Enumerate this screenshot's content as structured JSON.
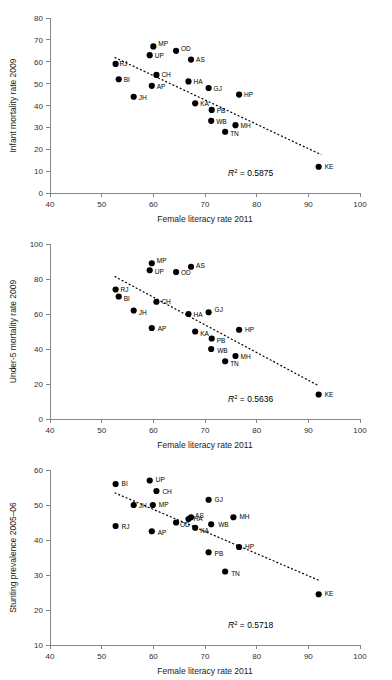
{
  "page": {
    "background_color": "#ffffff",
    "point_color": "#000000",
    "axis_color": "#868686",
    "trendline_color": "#000000"
  },
  "shared": {
    "xlabel": "Female literacy rate 2011",
    "xticks": [
      "40",
      "50",
      "60",
      "70",
      "80",
      "90",
      "100"
    ],
    "r2_symbol": "R",
    "r2_exponent": "2",
    "r2_equals": " = "
  },
  "chart_data": [
    {
      "id": "infant-mortality",
      "type": "scatter",
      "title": "",
      "xlabel": "Female literacy rate 2011",
      "ylabel": "Infant mortality rate 2009",
      "xlim": [
        40,
        100
      ],
      "ylim": [
        0,
        80
      ],
      "xticks": [
        40,
        50,
        60,
        70,
        80,
        90,
        100
      ],
      "yticks": [
        0,
        10,
        20,
        30,
        40,
        50,
        60,
        70,
        80
      ],
      "grid": false,
      "legend": "none",
      "r2": "0.5875",
      "r2_label": "R2 = 0.5875",
      "trendline": {
        "x0": 52.5,
        "y0": 62.0,
        "x1": 92.5,
        "y1": 17.5
      },
      "points": [
        {
          "label": "RJ",
          "x": 52.7,
          "y": 59,
          "lx": 4,
          "ly": 2
        },
        {
          "label": "BI",
          "x": 53.3,
          "y": 52,
          "lx": 5,
          "ly": 3
        },
        {
          "label": "JH",
          "x": 56.2,
          "y": 44,
          "lx": 5,
          "ly": 3
        },
        {
          "label": "MP",
          "x": 60.0,
          "y": 67,
          "lx": 5,
          "ly": 0
        },
        {
          "label": "UP",
          "x": 59.3,
          "y": 63,
          "lx": 5,
          "ly": 3
        },
        {
          "label": "AP",
          "x": 59.7,
          "y": 49,
          "lx": 5,
          "ly": 3
        },
        {
          "label": "CH",
          "x": 60.6,
          "y": 54,
          "lx": 5,
          "ly": 2
        },
        {
          "label": "OD",
          "x": 64.4,
          "y": 65,
          "lx": 5,
          "ly": 0
        },
        {
          "label": "AS",
          "x": 67.3,
          "y": 61,
          "lx": 5,
          "ly": 2
        },
        {
          "label": "HA",
          "x": 66.8,
          "y": 51,
          "lx": 5,
          "ly": 3
        },
        {
          "label": "GJ",
          "x": 70.7,
          "y": 48,
          "lx": 5,
          "ly": 3
        },
        {
          "label": "HP",
          "x": 76.6,
          "y": 45,
          "lx": 5,
          "ly": 2
        },
        {
          "label": "KA",
          "x": 68.1,
          "y": 41,
          "lx": 5,
          "ly": 3
        },
        {
          "label": "PB",
          "x": 71.3,
          "y": 38,
          "lx": 5,
          "ly": 3
        },
        {
          "label": "WB",
          "x": 71.2,
          "y": 33,
          "lx": 5,
          "ly": 3
        },
        {
          "label": "MH",
          "x": 75.9,
          "y": 31,
          "lx": 5,
          "ly": 3
        },
        {
          "label": "TN",
          "x": 73.9,
          "y": 28,
          "lx": 5,
          "ly": 4
        },
        {
          "label": "KE",
          "x": 92.0,
          "y": 12,
          "lx": 6,
          "ly": 2
        }
      ]
    },
    {
      "id": "under5-mortality",
      "type": "scatter",
      "title": "",
      "xlabel": "Female literacy rate 2011",
      "ylabel": "Under-5 mortality rate 2009",
      "xlim": [
        40,
        100
      ],
      "ylim": [
        0,
        100
      ],
      "xticks": [
        40,
        50,
        60,
        70,
        80,
        90,
        100
      ],
      "yticks": [
        0,
        20,
        40,
        60,
        80,
        100
      ],
      "grid": false,
      "legend": "none",
      "r2": "0.5636",
      "r2_label": "R2 = 0.5636",
      "trendline": {
        "x0": 52.5,
        "y0": 81.5,
        "x1": 92.0,
        "y1": 19.0
      },
      "points": [
        {
          "label": "RJ",
          "x": 52.7,
          "y": 74,
          "lx": 5,
          "ly": 2
        },
        {
          "label": "BI",
          "x": 53.3,
          "y": 70,
          "lx": 5,
          "ly": 4
        },
        {
          "label": "JH",
          "x": 56.2,
          "y": 62,
          "lx": 5,
          "ly": 4
        },
        {
          "label": "MP",
          "x": 59.7,
          "y": 89,
          "lx": 5,
          "ly": 0
        },
        {
          "label": "UP",
          "x": 59.3,
          "y": 85,
          "lx": 5,
          "ly": 4
        },
        {
          "label": "AP",
          "x": 59.7,
          "y": 52,
          "lx": 6,
          "ly": 3
        },
        {
          "label": "CH",
          "x": 60.6,
          "y": 67,
          "lx": 5,
          "ly": 2
        },
        {
          "label": "OD",
          "x": 64.4,
          "y": 84,
          "lx": 5,
          "ly": 3
        },
        {
          "label": "AS",
          "x": 67.3,
          "y": 87,
          "lx": 5,
          "ly": 1
        },
        {
          "label": "HA",
          "x": 66.8,
          "y": 60,
          "lx": 5,
          "ly": 3
        },
        {
          "label": "GJ",
          "x": 70.7,
          "y": 61,
          "lx": 6,
          "ly": 0
        },
        {
          "label": "HP",
          "x": 76.6,
          "y": 51,
          "lx": 6,
          "ly": 2
        },
        {
          "label": "KA",
          "x": 68.1,
          "y": 50,
          "lx": 5,
          "ly": 4
        },
        {
          "label": "PB",
          "x": 71.3,
          "y": 46,
          "lx": 5,
          "ly": 4
        },
        {
          "label": "WB",
          "x": 71.2,
          "y": 40,
          "lx": 6,
          "ly": 4
        },
        {
          "label": "MH",
          "x": 75.9,
          "y": 36,
          "lx": 5,
          "ly": 3
        },
        {
          "label": "TN",
          "x": 73.9,
          "y": 33,
          "lx": 5,
          "ly": 5
        },
        {
          "label": "KE",
          "x": 92.0,
          "y": 14,
          "lx": 6,
          "ly": 2
        }
      ]
    },
    {
      "id": "stunting-prevalence",
      "type": "scatter",
      "title": "",
      "xlabel": "Female literacy rate 2011",
      "ylabel": "Stunting prevalence 2005–06",
      "xlim": [
        40,
        100
      ],
      "ylim": [
        10,
        60
      ],
      "xticks": [
        40,
        50,
        60,
        70,
        80,
        90,
        100
      ],
      "yticks": [
        10,
        20,
        30,
        40,
        50,
        60
      ],
      "grid": false,
      "legend": "none",
      "r2": "0.5718",
      "r2_label": "R2 = 0.5718",
      "trendline": {
        "x0": 52.5,
        "y0": 53.5,
        "x1": 92.0,
        "y1": 28.5
      },
      "points": [
        {
          "label": "BI",
          "x": 52.7,
          "y": 56,
          "lx": 6,
          "ly": 2
        },
        {
          "label": "RJ",
          "x": 52.7,
          "y": 44,
          "lx": 6,
          "ly": 3
        },
        {
          "label": "JH",
          "x": 56.2,
          "y": 50,
          "lx": 5,
          "ly": 3
        },
        {
          "label": "UP",
          "x": 59.3,
          "y": 57,
          "lx": 6,
          "ly": 1
        },
        {
          "label": "MP",
          "x": 59.9,
          "y": 50,
          "lx": 6,
          "ly": 2
        },
        {
          "label": "AP",
          "x": 59.7,
          "y": 42.5,
          "lx": 6,
          "ly": 4
        },
        {
          "label": "CH",
          "x": 60.6,
          "y": 54,
          "lx": 6,
          "ly": 3
        },
        {
          "label": "OD",
          "x": 64.4,
          "y": 45,
          "lx": 4,
          "ly": 4
        },
        {
          "label": "HA",
          "x": 66.8,
          "y": 46,
          "lx": 5,
          "ly": 2
        },
        {
          "label": "AS",
          "x": 67.3,
          "y": 46.5,
          "lx": 4,
          "ly": 1
        },
        {
          "label": "KA",
          "x": 68.1,
          "y": 43.5,
          "lx": 5,
          "ly": 5
        },
        {
          "label": "GJ",
          "x": 70.7,
          "y": 51.5,
          "lx": 6,
          "ly": 2
        },
        {
          "label": "WB",
          "x": 71.2,
          "y": 44.5,
          "lx": 7,
          "ly": 3
        },
        {
          "label": "PB",
          "x": 70.7,
          "y": 36.5,
          "lx": 6,
          "ly": 4
        },
        {
          "label": "MH",
          "x": 75.5,
          "y": 46.5,
          "lx": 6,
          "ly": 2
        },
        {
          "label": "TN",
          "x": 73.9,
          "y": 31,
          "lx": 6,
          "ly": 4
        },
        {
          "label": "HP",
          "x": 76.6,
          "y": 38,
          "lx": 6,
          "ly": 2
        },
        {
          "label": "KE",
          "x": 92.0,
          "y": 24.5,
          "lx": 6,
          "ly": 2
        }
      ]
    }
  ]
}
